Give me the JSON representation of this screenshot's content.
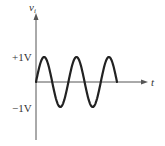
{
  "diagram": {
    "y_axis_label": "v",
    "y_axis_subscript": "i",
    "x_axis_label": "t",
    "upper_level_label": "+1V",
    "lower_level_label": "−1V",
    "waveform": "sine",
    "cycles": 2.5,
    "amplitude_volts": 1,
    "colors": {
      "axis": "#555555",
      "wave": "#222222",
      "text": "#333333"
    }
  },
  "chart_data": {
    "type": "line",
    "title": "",
    "xlabel": "t",
    "ylabel": "v_i",
    "yticks": [
      "+1V",
      "-1V"
    ],
    "ylim": [
      -1,
      1
    ],
    "series": [
      {
        "name": "v_i",
        "description": "sine wave, amplitude 1 V, 2.5 cycles starting at 0 going positive",
        "x": [
          0,
          0.25,
          0.5,
          0.75,
          1.0,
          1.25,
          1.5,
          1.75,
          2.0,
          2.25,
          2.5
        ],
        "values": [
          0,
          1,
          0,
          -1,
          0,
          1,
          0,
          -1,
          0,
          1,
          0
        ]
      }
    ]
  }
}
